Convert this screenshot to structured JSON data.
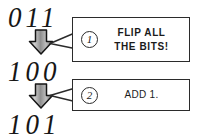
{
  "diagram": {
    "ink_color": "#1b1b1b",
    "paper_color": "#ffffff",
    "binary_values": [
      {
        "id": "start",
        "text": "011"
      },
      {
        "id": "middle",
        "text": "100"
      },
      {
        "id": "result",
        "text": "101"
      }
    ],
    "arrows": [
      {
        "id": "arrow-flip",
        "direction": "down",
        "icon": "down-block-arrow"
      },
      {
        "id": "arrow-add",
        "direction": "down",
        "icon": "down-block-arrow"
      }
    ],
    "callouts": [
      {
        "id": "step-1",
        "marker": "1",
        "text": "FLIP ALL\nTHE BITS!"
      },
      {
        "id": "step-2",
        "marker": "2",
        "text": "ADD 1."
      }
    ]
  }
}
